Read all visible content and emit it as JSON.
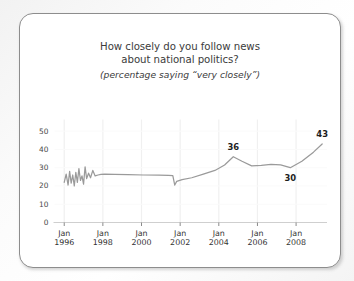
{
  "card": {
    "title_lines": [
      "How closely do you follow news",
      "about national politics?"
    ],
    "subtitle": "(percentage saying “very closely”)"
  },
  "chart_data": {
    "type": "line",
    "title": "How closely do you follow news about national politics?",
    "subtitle": "(percentage saying “very closely”)",
    "xlabel": "",
    "ylabel": "",
    "xlim": [
      1995.6,
      2009.6
    ],
    "ylim": [
      0,
      52
    ],
    "grid": "vertical-only",
    "legend": "none",
    "line_color": "#9a9a9a",
    "ytick_labels": [
      "0",
      "10",
      "20",
      "30",
      "40",
      "50"
    ],
    "ytick_values": [
      0,
      10,
      20,
      30,
      40,
      50
    ],
    "xtick_labels": [
      [
        "Jan",
        "1996"
      ],
      [
        "Jan",
        "1998"
      ],
      [
        "Jan",
        "2000"
      ],
      [
        "Jan",
        "2002"
      ],
      [
        "Jan",
        "2004"
      ],
      [
        "Jan",
        "2006"
      ],
      [
        "Jan",
        "2008"
      ]
    ],
    "xtick_values": [
      1996,
      1998,
      2000,
      2002,
      2004,
      2006,
      2008
    ],
    "x": [
      1996.0,
      1996.1,
      1996.2,
      1996.28,
      1996.36,
      1996.44,
      1996.52,
      1996.6,
      1996.68,
      1996.76,
      1996.84,
      1996.92,
      1997.0,
      1997.08,
      1997.16,
      1997.26,
      1997.36,
      1997.48,
      1997.6,
      1997.75,
      1997.9,
      1998.1,
      1998.6,
      1999.3,
      2000.1,
      2000.9,
      2001.4,
      2001.62,
      2001.72,
      2001.82,
      2002.1,
      2002.6,
      2003.2,
      2003.8,
      2004.3,
      2004.75,
      2005.2,
      2005.7,
      2006.2,
      2006.7,
      2007.2,
      2007.7,
      2008.3,
      2008.9,
      2009.35
    ],
    "y": [
      22.0,
      26.5,
      20.5,
      28.0,
      21.5,
      26.0,
      20.0,
      27.5,
      22.0,
      29.5,
      23.0,
      25.5,
      21.0,
      30.5,
      24.0,
      27.0,
      24.5,
      28.5,
      25.5,
      26.0,
      26.3,
      26.5,
      26.4,
      26.2,
      26.0,
      25.9,
      25.8,
      25.7,
      20.5,
      22.5,
      23.5,
      24.5,
      26.5,
      28.5,
      31.5,
      36.0,
      33.5,
      31.0,
      31.3,
      31.8,
      31.5,
      30.0,
      33.5,
      38.5,
      43.0
    ],
    "annotations": [
      {
        "label": "36",
        "x": 2004.75,
        "y": 36,
        "position": "above"
      },
      {
        "label": "30",
        "x": 2007.7,
        "y": 30,
        "position": "below"
      },
      {
        "label": "43",
        "x": 2009.35,
        "y": 43,
        "position": "above"
      }
    ]
  }
}
